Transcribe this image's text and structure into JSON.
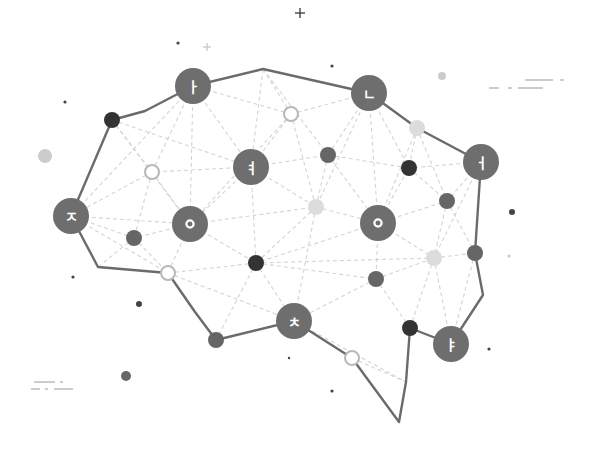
{
  "illustration": {
    "title": "Brain network of Korean hangul characters",
    "colors": {
      "background": "#ffffff",
      "outline": "#6b6b6b",
      "big_node": "#6e6e6e",
      "dark_node": "#333333",
      "mid_node": "#666666",
      "light_node": "#dcdcdc",
      "hollow_stroke": "#b8b8b8",
      "dashed_line": "#d4d4d4",
      "label_text": "#ffffff",
      "decor_dark": "#444444",
      "decor_light": "#cccccc"
    },
    "character_nodes": [
      {
        "id": "a",
        "char": "ㅏ",
        "x": 193,
        "y": 86,
        "r": 18
      },
      {
        "id": "n",
        "char": "ㄴ",
        "x": 369,
        "y": 93,
        "r": 18
      },
      {
        "id": "eo",
        "char": "ㅓ",
        "x": 481,
        "y": 162,
        "r": 18
      },
      {
        "id": "yeo",
        "char": "ㅕ",
        "x": 251,
        "y": 167,
        "r": 18
      },
      {
        "id": "j",
        "char": "ㅈ",
        "x": 71,
        "y": 216,
        "r": 18
      },
      {
        "id": "o1",
        "char": "ㅇ",
        "x": 190,
        "y": 224,
        "r": 18
      },
      {
        "id": "o2",
        "char": "ㅇ",
        "x": 378,
        "y": 223,
        "r": 18
      },
      {
        "id": "ch",
        "char": "ㅊ",
        "x": 294,
        "y": 321,
        "r": 18
      },
      {
        "id": "ya",
        "char": "ㅑ",
        "x": 451,
        "y": 344,
        "r": 18
      }
    ],
    "small_nodes": [
      {
        "x": 112,
        "y": 120,
        "r": 8,
        "style": "dark"
      },
      {
        "x": 152,
        "y": 172,
        "r": 8,
        "style": "hollow"
      },
      {
        "x": 291,
        "y": 114,
        "r": 8,
        "style": "hollow"
      },
      {
        "x": 328,
        "y": 155,
        "r": 8,
        "style": "mid"
      },
      {
        "x": 417,
        "y": 128,
        "r": 8,
        "style": "light"
      },
      {
        "x": 409,
        "y": 168,
        "r": 8,
        "style": "dark"
      },
      {
        "x": 447,
        "y": 201,
        "r": 8,
        "style": "mid"
      },
      {
        "x": 316,
        "y": 207,
        "r": 8,
        "style": "light"
      },
      {
        "x": 134,
        "y": 238,
        "r": 8,
        "style": "mid"
      },
      {
        "x": 168,
        "y": 273,
        "r": 8,
        "style": "hollow"
      },
      {
        "x": 256,
        "y": 263,
        "r": 8,
        "style": "dark"
      },
      {
        "x": 434,
        "y": 258,
        "r": 8,
        "style": "light"
      },
      {
        "x": 475,
        "y": 253,
        "r": 8,
        "style": "mid"
      },
      {
        "x": 376,
        "y": 279,
        "r": 8,
        "style": "mid"
      },
      {
        "x": 216,
        "y": 340,
        "r": 8,
        "style": "mid"
      },
      {
        "x": 410,
        "y": 328,
        "r": 8,
        "style": "dark"
      },
      {
        "x": 352,
        "y": 358,
        "r": 8,
        "style": "hollow"
      }
    ],
    "outline_path": "M112,120 L145,111 L193,86 L263,69 L369,93 L417,128 L481,162 L475,253 L483,295 L451,344 L410,328 L406,382 L399,422 L352,358 L294,321 L216,340 L195,312 L168,273 L98,267 L71,216 L112,120",
    "decorations": {
      "plus_marks": [
        {
          "x": 300,
          "y": 13,
          "size": 5,
          "style": "dark"
        },
        {
          "x": 207,
          "y": 47,
          "size": 4,
          "style": "light"
        }
      ],
      "dots": [
        {
          "x": 178,
          "y": 43,
          "r": 1.6,
          "style": "dark"
        },
        {
          "x": 332,
          "y": 66,
          "r": 1.6,
          "style": "dark"
        },
        {
          "x": 65,
          "y": 102,
          "r": 1.6,
          "style": "dark"
        },
        {
          "x": 442,
          "y": 76,
          "r": 4,
          "style": "light"
        },
        {
          "x": 45,
          "y": 156,
          "r": 7,
          "style": "light"
        },
        {
          "x": 512,
          "y": 212,
          "r": 3,
          "style": "dark"
        },
        {
          "x": 73,
          "y": 277,
          "r": 1.6,
          "style": "dark"
        },
        {
          "x": 139,
          "y": 304,
          "r": 3,
          "style": "dark"
        },
        {
          "x": 509,
          "y": 256,
          "r": 1.6,
          "style": "light"
        },
        {
          "x": 126,
          "y": 376,
          "r": 5,
          "style": "mid"
        },
        {
          "x": 289,
          "y": 358,
          "r": 1.2,
          "style": "dark"
        },
        {
          "x": 332,
          "y": 391,
          "r": 1.6,
          "style": "dark"
        },
        {
          "x": 489,
          "y": 349,
          "r": 1.6,
          "style": "dark"
        }
      ],
      "dash_lines_right": [
        {
          "x1": 525,
          "y1": 80,
          "x2": 553,
          "y2": 80
        },
        {
          "x1": 560,
          "y1": 80,
          "x2": 564,
          "y2": 80
        },
        {
          "x1": 489,
          "y1": 88,
          "x2": 499,
          "y2": 88
        },
        {
          "x1": 508,
          "y1": 88,
          "x2": 512,
          "y2": 88
        },
        {
          "x1": 518,
          "y1": 88,
          "x2": 543,
          "y2": 88
        }
      ],
      "dash_lines_left": [
        {
          "x1": 34,
          "y1": 382,
          "x2": 55,
          "y2": 382
        },
        {
          "x1": 60,
          "y1": 382,
          "x2": 63,
          "y2": 382
        },
        {
          "x1": 31,
          "y1": 389,
          "x2": 40,
          "y2": 389
        },
        {
          "x1": 45,
          "y1": 389,
          "x2": 48,
          "y2": 389
        },
        {
          "x1": 54,
          "y1": 389,
          "x2": 73,
          "y2": 389
        }
      ]
    },
    "dashed_connections": [
      [
        193,
        86,
        152,
        172
      ],
      [
        193,
        86,
        251,
        167
      ],
      [
        193,
        86,
        291,
        114
      ],
      [
        193,
        86,
        190,
        224
      ],
      [
        112,
        120,
        152,
        172
      ],
      [
        112,
        120,
        251,
        167
      ],
      [
        112,
        120,
        190,
        224
      ],
      [
        263,
        69,
        251,
        167
      ],
      [
        263,
        69,
        291,
        114
      ],
      [
        263,
        69,
        328,
        155
      ],
      [
        369,
        93,
        291,
        114
      ],
      [
        369,
        93,
        328,
        155
      ],
      [
        369,
        93,
        409,
        168
      ],
      [
        369,
        93,
        316,
        207
      ],
      [
        369,
        93,
        378,
        223
      ],
      [
        417,
        128,
        409,
        168
      ],
      [
        417,
        128,
        447,
        201
      ],
      [
        417,
        128,
        378,
        223
      ],
      [
        417,
        128,
        481,
        162
      ],
      [
        481,
        162,
        409,
        168
      ],
      [
        481,
        162,
        447,
        201
      ],
      [
        481,
        162,
        434,
        258
      ],
      [
        291,
        114,
        251,
        167
      ],
      [
        291,
        114,
        316,
        207
      ],
      [
        291,
        114,
        190,
        224
      ],
      [
        251,
        167,
        152,
        172
      ],
      [
        251,
        167,
        328,
        155
      ],
      [
        251,
        167,
        316,
        207
      ],
      [
        251,
        167,
        256,
        263
      ],
      [
        251,
        167,
        190,
        224
      ],
      [
        328,
        155,
        316,
        207
      ],
      [
        328,
        155,
        409,
        168
      ],
      [
        328,
        155,
        378,
        223
      ],
      [
        152,
        172,
        71,
        216
      ],
      [
        152,
        172,
        190,
        224
      ],
      [
        152,
        172,
        134,
        238
      ],
      [
        71,
        216,
        134,
        238
      ],
      [
        71,
        216,
        190,
        224
      ],
      [
        71,
        216,
        168,
        273
      ],
      [
        71,
        216,
        193,
        86
      ],
      [
        190,
        224,
        134,
        238
      ],
      [
        190,
        224,
        168,
        273
      ],
      [
        190,
        224,
        256,
        263
      ],
      [
        190,
        224,
        316,
        207
      ],
      [
        134,
        238,
        168,
        273
      ],
      [
        134,
        238,
        98,
        267
      ],
      [
        168,
        273,
        256,
        263
      ],
      [
        168,
        273,
        216,
        340
      ],
      [
        168,
        273,
        294,
        321
      ],
      [
        316,
        207,
        256,
        263
      ],
      [
        316,
        207,
        378,
        223
      ],
      [
        316,
        207,
        294,
        321
      ],
      [
        378,
        223,
        409,
        168
      ],
      [
        378,
        223,
        447,
        201
      ],
      [
        378,
        223,
        256,
        263
      ],
      [
        378,
        223,
        376,
        279
      ],
      [
        378,
        223,
        434,
        258
      ],
      [
        409,
        168,
        447,
        201
      ],
      [
        447,
        201,
        434,
        258
      ],
      [
        447,
        201,
        475,
        253
      ],
      [
        256,
        263,
        294,
        321
      ],
      [
        256,
        263,
        216,
        340
      ],
      [
        256,
        263,
        376,
        279
      ],
      [
        256,
        263,
        434,
        258
      ],
      [
        376,
        279,
        294,
        321
      ],
      [
        376,
        279,
        410,
        328
      ],
      [
        376,
        279,
        434,
        258
      ],
      [
        434,
        258,
        475,
        253
      ],
      [
        434,
        258,
        410,
        328
      ],
      [
        434,
        258,
        451,
        344
      ],
      [
        294,
        321,
        352,
        358
      ],
      [
        352,
        358,
        406,
        382
      ],
      [
        406,
        382,
        410,
        328
      ],
      [
        294,
        321,
        406,
        382
      ],
      [
        475,
        253,
        451,
        344
      ],
      [
        216,
        340,
        294,
        321
      ]
    ]
  }
}
